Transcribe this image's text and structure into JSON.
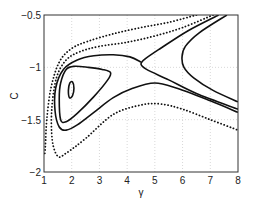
{
  "chart_data": {
    "type": "line",
    "title": "",
    "xlabel": "γ",
    "ylabel": "C",
    "xlim": [
      1,
      8
    ],
    "ylim": [
      -2,
      -0.5
    ],
    "xticks": [
      "1",
      "2",
      "3",
      "4",
      "5",
      "6",
      "7",
      "8"
    ],
    "yticks": [
      "-2",
      "-1.5",
      "-1",
      "-0.5"
    ],
    "grid": true,
    "legend": "none",
    "series": [
      {
        "name": "inner-small-loop",
        "style": "solid",
        "closed": true,
        "points": [
          [
            1.88,
            -1.22
          ],
          [
            1.93,
            -1.15
          ],
          [
            2.03,
            -1.14
          ],
          [
            2.08,
            -1.2
          ],
          [
            2.03,
            -1.27
          ],
          [
            1.92,
            -1.29
          ],
          [
            1.88,
            -1.22
          ]
        ]
      },
      {
        "name": "closed-orbit",
        "style": "solid",
        "closed": true,
        "points": [
          [
            1.55,
            -1.3
          ],
          [
            1.6,
            -1.15
          ],
          [
            1.8,
            -1.02
          ],
          [
            2.1,
            -0.99
          ],
          [
            2.6,
            -1.0
          ],
          [
            3.1,
            -1.02
          ],
          [
            3.4,
            -1.05
          ],
          [
            3.3,
            -1.12
          ],
          [
            2.8,
            -1.28
          ],
          [
            2.2,
            -1.44
          ],
          [
            1.8,
            -1.52
          ],
          [
            1.6,
            -1.5
          ],
          [
            1.55,
            -1.3
          ]
        ]
      },
      {
        "name": "separatrix-left",
        "style": "solid",
        "points": [
          [
            4.5,
            -0.95
          ],
          [
            4.1,
            -0.9
          ],
          [
            3.5,
            -0.88
          ],
          [
            2.8,
            -0.89
          ],
          [
            2.2,
            -0.93
          ],
          [
            1.7,
            -1.02
          ],
          [
            1.42,
            -1.2
          ],
          [
            1.4,
            -1.42
          ],
          [
            1.55,
            -1.57
          ],
          [
            1.8,
            -1.6
          ],
          [
            2.2,
            -1.55
          ],
          [
            2.8,
            -1.43
          ],
          [
            3.5,
            -1.29
          ],
          [
            4.2,
            -1.2
          ],
          [
            5.0,
            -1.15
          ],
          [
            5.8,
            -1.2
          ],
          [
            7.0,
            -1.32
          ],
          [
            8.0,
            -1.43
          ]
        ]
      },
      {
        "name": "separatrix-right",
        "style": "solid",
        "points": [
          [
            7.3,
            -0.5
          ],
          [
            6.2,
            -0.65
          ],
          [
            5.2,
            -0.82
          ],
          [
            4.65,
            -0.92
          ],
          [
            4.5,
            -0.97
          ],
          [
            4.7,
            -1.02
          ],
          [
            5.5,
            -1.12
          ],
          [
            6.5,
            -1.25
          ],
          [
            8.0,
            -1.4
          ]
        ]
      },
      {
        "name": "right-branch",
        "style": "solid",
        "points": [
          [
            7.6,
            -0.5
          ],
          [
            6.6,
            -0.67
          ],
          [
            6.1,
            -0.8
          ],
          [
            5.98,
            -0.9
          ],
          [
            6.05,
            -1.0
          ],
          [
            6.4,
            -1.1
          ],
          [
            7.1,
            -1.22
          ],
          [
            8.0,
            -1.33
          ]
        ]
      },
      {
        "name": "outer-lower-dotted",
        "style": "dotted",
        "points": [
          [
            7.1,
            -0.5
          ],
          [
            6.0,
            -0.62
          ],
          [
            5.0,
            -0.7
          ],
          [
            4.0,
            -0.76
          ],
          [
            3.0,
            -0.8
          ],
          [
            2.3,
            -0.85
          ],
          [
            1.8,
            -0.93
          ],
          [
            1.45,
            -1.1
          ],
          [
            1.28,
            -1.4
          ],
          [
            1.3,
            -1.7
          ],
          [
            1.5,
            -1.85
          ],
          [
            1.8,
            -1.82
          ],
          [
            2.5,
            -1.68
          ],
          [
            3.5,
            -1.45
          ],
          [
            4.5,
            -1.36
          ],
          [
            5.2,
            -1.35
          ],
          [
            6.0,
            -1.4
          ],
          [
            7.0,
            -1.5
          ],
          [
            8.0,
            -1.6
          ]
        ]
      },
      {
        "name": "outer-dotted",
        "style": "dotted",
        "points": [
          [
            6.5,
            -0.5
          ],
          [
            5.5,
            -0.57
          ],
          [
            4.5,
            -0.62
          ],
          [
            3.5,
            -0.68
          ],
          [
            2.6,
            -0.75
          ],
          [
            2.0,
            -0.82
          ],
          [
            1.55,
            -0.95
          ],
          [
            1.25,
            -1.2
          ],
          [
            1.1,
            -1.5
          ],
          [
            1.05,
            -1.75
          ],
          [
            1.02,
            -1.85
          ]
        ]
      }
    ]
  }
}
